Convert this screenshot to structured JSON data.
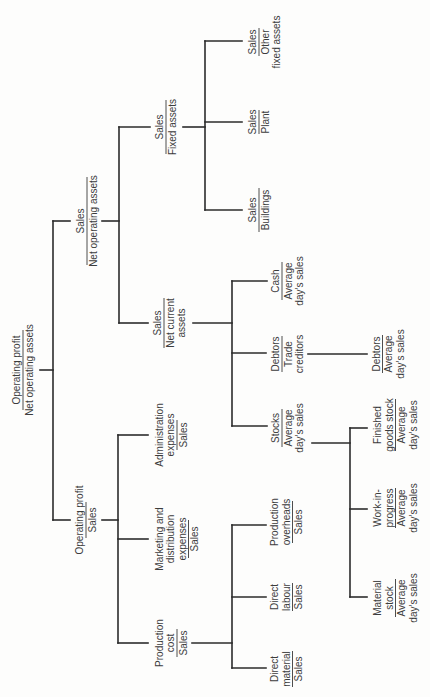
{
  "diagram": {
    "orientation": "rotated 90 degrees counter-clockwise (reads bottom to top)",
    "colors": {
      "background": "#fdfdfc",
      "lines": "#2b2b2b",
      "text": "#3c3c3c"
    },
    "nodes": {
      "root": {
        "numerator": [
          "Operating profit"
        ],
        "denominator": [
          "Net operating assets"
        ]
      },
      "sales_noa": {
        "numerator": [
          "Sales"
        ],
        "denominator": [
          "Net operating assets"
        ]
      },
      "op_sales": {
        "numerator": [
          "Operating profit"
        ],
        "denominator": [
          "Sales"
        ]
      },
      "fixed": {
        "numerator": [
          "Sales"
        ],
        "denominator": [
          "Fixed assets"
        ]
      },
      "current": {
        "numerator": [
          "Sales"
        ],
        "denominator": [
          "Net current",
          "assets"
        ]
      },
      "admin": {
        "numerator": [
          "Administration",
          "expenses"
        ],
        "denominator": [
          "Sales"
        ]
      },
      "marketing": {
        "numerator": [
          "Marketing and",
          "distribution",
          "expenses"
        ],
        "denominator": [
          "Sales"
        ]
      },
      "production": {
        "numerator": [
          "Production",
          "cost"
        ],
        "denominator": [
          "Sales"
        ]
      },
      "other": {
        "numerator": [
          "Sales"
        ],
        "denominator": [
          "Other",
          "fixed assets"
        ]
      },
      "plant": {
        "numerator": [
          "Sales"
        ],
        "denominator": [
          "Plant"
        ]
      },
      "buildings": {
        "numerator": [
          "Sales"
        ],
        "denominator": [
          "Buildings"
        ]
      },
      "cash": {
        "numerator": [
          "Cash"
        ],
        "denominator": [
          "Average",
          "day’s sales"
        ]
      },
      "debtors_tc": {
        "numerator": [
          "Debtors"
        ],
        "denominator": [
          "Trade",
          "creditors"
        ]
      },
      "stocks": {
        "numerator": [
          "Stocks"
        ],
        "denominator": [
          "Average",
          "day’s sales"
        ]
      },
      "debtors_ads": {
        "numerator": [
          "Debtors"
        ],
        "denominator": [
          "Average",
          "day’s sales"
        ]
      },
      "finished": {
        "numerator": [
          "Finished",
          "goods stock"
        ],
        "denominator": [
          "Average",
          "day’s sales"
        ]
      },
      "wip": {
        "numerator": [
          "Work-in-",
          "progress"
        ],
        "denominator": [
          "Average",
          "day’s sales"
        ]
      },
      "material": {
        "numerator": [
          "Material",
          "stock"
        ],
        "denominator": [
          "Average",
          "day’s sales"
        ]
      },
      "prod_overheads": {
        "numerator": [
          "Production",
          "overheads"
        ],
        "denominator": [
          "Sales"
        ]
      },
      "direct_labour": {
        "numerator": [
          "Direct",
          "labour"
        ],
        "denominator": [
          "Sales"
        ]
      },
      "direct_material": {
        "numerator": [
          "Direct",
          "material"
        ],
        "denominator": [
          "Sales"
        ]
      }
    },
    "edges": [
      [
        "root",
        "sales_noa"
      ],
      [
        "root",
        "op_sales"
      ],
      [
        "sales_noa",
        "fixed"
      ],
      [
        "sales_noa",
        "current"
      ],
      [
        "fixed",
        "other"
      ],
      [
        "fixed",
        "plant"
      ],
      [
        "fixed",
        "buildings"
      ],
      [
        "current",
        "cash"
      ],
      [
        "current",
        "debtors_tc"
      ],
      [
        "current",
        "stocks"
      ],
      [
        "debtors_tc",
        "debtors_ads"
      ],
      [
        "stocks",
        "finished"
      ],
      [
        "stocks",
        "wip"
      ],
      [
        "stocks",
        "material"
      ],
      [
        "op_sales",
        "admin"
      ],
      [
        "op_sales",
        "marketing"
      ],
      [
        "op_sales",
        "production"
      ],
      [
        "production",
        "prod_overheads"
      ],
      [
        "production",
        "direct_labour"
      ],
      [
        "production",
        "direct_material"
      ]
    ]
  }
}
